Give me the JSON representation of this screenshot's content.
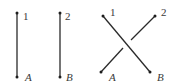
{
  "diagram": {
    "colors": {
      "stroke": "#2a2a2a",
      "label": "#3a3a3a",
      "background": "#ffffff"
    },
    "panels": [
      {
        "name": "parallel-strands",
        "strands": [
          {
            "top_label": "1",
            "bottom_label": "A"
          },
          {
            "top_label": "2",
            "bottom_label": "B"
          }
        ]
      },
      {
        "name": "crossing-strands",
        "strands": [
          {
            "top_label": "1",
            "bottom_label": "B",
            "over": true
          },
          {
            "top_label": "2",
            "bottom_label": "A",
            "over": false
          }
        ]
      }
    ]
  }
}
